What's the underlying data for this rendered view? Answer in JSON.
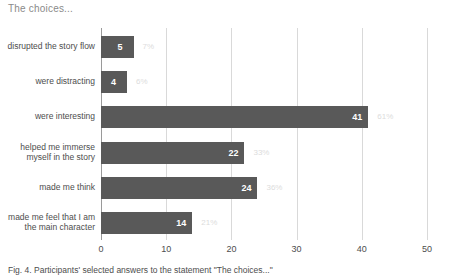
{
  "chart_title": "The choices...",
  "caption": "Fig. 4. Participants' selected answers to the statement \"The choices...\"",
  "colors": {
    "bar_fill": "#595959",
    "gridline": "#d9d9d9",
    "axis": "#9a9a9a",
    "value_label": "#ffffff",
    "percent_label": "#dcdcdc",
    "title": "#8a8a8a"
  },
  "chart_data": {
    "type": "bar",
    "orientation": "horizontal",
    "title": "The choices...",
    "xlabel": "",
    "ylabel": "",
    "xlim": [
      0,
      50
    ],
    "xticks": [
      "0",
      "10",
      "20",
      "30",
      "40",
      "50"
    ],
    "grid": true,
    "legend": "none",
    "categories": [
      "disrupted the story flow",
      "were distracting",
      "were interesting",
      "helped me immerse myself in the story",
      "made me think",
      "made me feel that I am the main character"
    ],
    "values": [
      5,
      4,
      41,
      22,
      24,
      14
    ],
    "percent_labels": [
      "7%",
      "6%",
      "61%",
      "33%",
      "36%",
      "21%"
    ],
    "value_labels": [
      "5",
      "4",
      "41",
      "22",
      "24",
      "14"
    ]
  }
}
